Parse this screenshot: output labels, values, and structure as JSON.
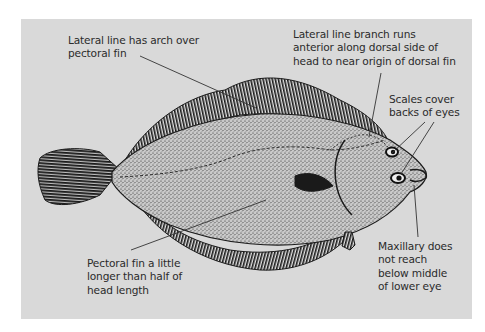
{
  "figure": {
    "background_color": "#d9d9d9",
    "ink_color": "#1a1a1a",
    "labels": [
      {
        "id": "lateral-arch",
        "text": "Lateral line has arch over\npectoral fin"
      },
      {
        "id": "lateral-branch",
        "text": "Lateral line branch runs\nanterior along dorsal side of\nhead to near origin of dorsal fin"
      },
      {
        "id": "scales-eyes",
        "text": "Scales cover\nbacks of eyes"
      },
      {
        "id": "pectoral-fin",
        "text": "Pectoral fin a little\nlonger than half of\nhead length"
      },
      {
        "id": "maxillary",
        "text": "Maxillary does\nnot reach\nbelow middle\nof lower eye"
      }
    ]
  }
}
